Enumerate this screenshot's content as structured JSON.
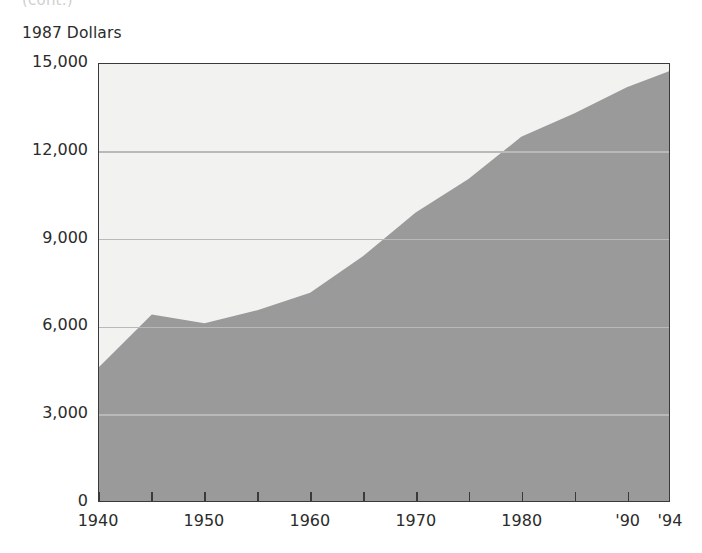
{
  "page": {
    "cut_off_caption": "(cont.)"
  },
  "chart_data": {
    "type": "area",
    "title": "",
    "subtitle": "",
    "xlabel": "",
    "ylabel": "1987 Dollars",
    "ylim": [
      0,
      15000
    ],
    "xlim": [
      1940,
      1994
    ],
    "grid": true,
    "legend": false,
    "legend_position": "none",
    "y_ticks": [
      15000,
      12000,
      9000,
      6000,
      3000,
      0
    ],
    "y_tick_labels": [
      "15,000",
      "12,000",
      "9,000",
      "6,000",
      "3,000",
      "0"
    ],
    "gridline_values": [
      12000,
      9000,
      6000,
      3000
    ],
    "x_ticks": [
      1940,
      1945,
      1950,
      1955,
      1960,
      1965,
      1970,
      1975,
      1980,
      1985,
      1990,
      1994
    ],
    "x_tick_labels": [
      {
        "value": 1940,
        "label": "1940"
      },
      {
        "value": 1950,
        "label": "1950"
      },
      {
        "value": 1960,
        "label": "1960"
      },
      {
        "value": 1970,
        "label": "1970"
      },
      {
        "value": 1980,
        "label": "1980"
      },
      {
        "value": 1990,
        "label": "'90"
      },
      {
        "value": 1994,
        "label": "'94"
      }
    ],
    "x": [
      1940,
      1945,
      1950,
      1955,
      1960,
      1965,
      1970,
      1975,
      1980,
      1985,
      1990,
      1994
    ],
    "values": [
      4600,
      6400,
      6100,
      6550,
      7150,
      8400,
      9900,
      11050,
      12500,
      13300,
      14200,
      14750
    ],
    "series": [
      {
        "name": "1987 Dollars",
        "values": [
          4600,
          6400,
          6100,
          6550,
          7150,
          8400,
          9900,
          11050,
          12500,
          13300,
          14200,
          14750
        ]
      }
    ],
    "colors": {
      "area_fill": "#9a9a9a",
      "plot_background": "#f2f2f0",
      "gridline": "#b9b9b9",
      "axis_border": "#3a3a3a",
      "text": "#2b2b2b"
    }
  }
}
